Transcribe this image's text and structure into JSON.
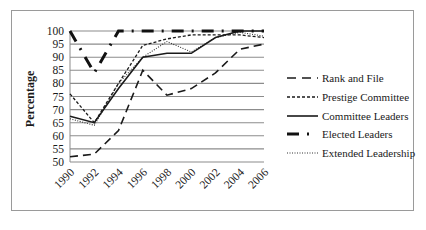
{
  "chart_data": {
    "type": "line",
    "title": "",
    "xlabel": "",
    "ylabel": "Percentage",
    "ylim": [
      50,
      100
    ],
    "yticks": [
      50,
      55,
      60,
      65,
      70,
      75,
      80,
      85,
      90,
      95,
      100
    ],
    "grid": true,
    "legend_position": "right",
    "categories": [
      "1990",
      "1992",
      "1994",
      "1996",
      "1998",
      "2000",
      "2002",
      "2004",
      "2006"
    ],
    "series": [
      {
        "name": "Rank and File",
        "style": "long-dash",
        "values": [
          52,
          53,
          62,
          85,
          75.5,
          78,
          84,
          93,
          95
        ]
      },
      {
        "name": "Prestige Committee",
        "style": "short-dash",
        "values": [
          76,
          65,
          80,
          94.5,
          97,
          98.5,
          98.5,
          98.5,
          97.5
        ]
      },
      {
        "name": "Committee Leaders",
        "style": "solid",
        "values": [
          67.5,
          65,
          78,
          90,
          91.5,
          91.5,
          97.5,
          100,
          100
        ]
      },
      {
        "name": "Elected Leaders",
        "style": "thick-dash-dot",
        "values": [
          100,
          84,
          100,
          100,
          100,
          100,
          100,
          100,
          100
        ]
      },
      {
        "name": "Extended Leadership",
        "style": "dotted",
        "values": [
          66.5,
          64,
          80,
          90,
          96,
          92,
          97.5,
          99.5,
          98
        ]
      }
    ]
  }
}
